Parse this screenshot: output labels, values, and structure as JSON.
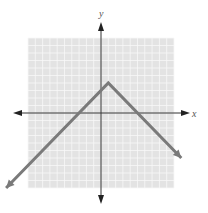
{
  "chart_data": {
    "type": "line",
    "title": "",
    "xlabel": "x",
    "ylabel": "y",
    "xlim": [
      -10,
      10
    ],
    "ylim": [
      -10,
      10
    ],
    "grid": true,
    "grid_step": 1,
    "series": [
      {
        "name": "y = -|x - 1| + 4",
        "vertex": [
          1,
          4
        ],
        "x": [
          -13,
          1,
          11
        ],
        "y": [
          -10,
          4,
          -6
        ]
      }
    ],
    "x_intercepts": [
      -3,
      5
    ],
    "y_intercept": 3
  },
  "labels": {
    "x": "x",
    "y": "y"
  },
  "colors": {
    "grid_bg": "#e3e3e3",
    "grid_line": "#f7f7f7",
    "axis": "#333333",
    "graph_line": "#7a7a7a"
  }
}
